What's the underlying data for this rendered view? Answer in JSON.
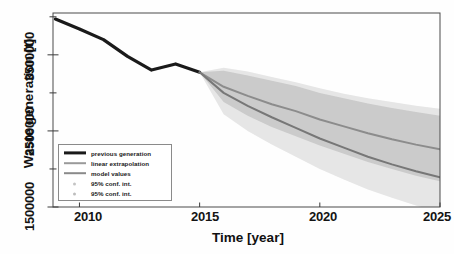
{
  "chart_data": {
    "type": "line",
    "title": "",
    "xlabel": "Time [year]",
    "ylabel": "Waste generation [t]",
    "xlim": [
      2008.9,
      2025
    ],
    "ylim": [
      1500000,
      4050000
    ],
    "xticks": [
      2010,
      2015,
      2020,
      2025
    ],
    "yticks": [
      1500000,
      2500000,
      3500000
    ],
    "ytick_labels": [
      "1500000",
      "2500000",
      "3500000"
    ],
    "yminor_ticks": [
      2000000,
      3000000,
      4000000
    ],
    "grid": false,
    "legend_position": "lower left",
    "series": [
      {
        "name": "previous generation",
        "type": "line",
        "color": "#1a1a1a",
        "width": 3.2,
        "x": [
          2009,
          2010,
          2011,
          2012,
          2013,
          2014,
          2015
        ],
        "values": [
          3970000,
          3840000,
          3700000,
          3480000,
          3300000,
          3380000,
          3270000
        ]
      },
      {
        "name": "linear extrapolation",
        "type": "line",
        "color": "#8c8c8c",
        "width": 2.0,
        "x": [
          2015,
          2016,
          2017,
          2018,
          2019,
          2020,
          2021,
          2022,
          2023,
          2024,
          2025
        ],
        "values": [
          3270000,
          3080000,
          2960000,
          2850000,
          2760000,
          2650000,
          2560000,
          2470000,
          2390000,
          2320000,
          2260000
        ]
      },
      {
        "name": "model values",
        "type": "line",
        "color": "#777777",
        "width": 2.0,
        "x": [
          2015,
          2016,
          2017,
          2018,
          2019,
          2020,
          2021,
          2022,
          2023,
          2024,
          2025
        ],
        "values": [
          3270000,
          3000000,
          2830000,
          2680000,
          2540000,
          2400000,
          2280000,
          2160000,
          2060000,
          1970000,
          1890000
        ]
      }
    ],
    "bands": [
      {
        "name": "95% conf. int.",
        "for": "linear extrapolation",
        "color": "#b9b9b9",
        "opacity": 0.62,
        "x": [
          2015,
          2016,
          2017,
          2018,
          2019,
          2020,
          2021,
          2022,
          2023,
          2024,
          2025
        ],
        "upper": [
          3270000,
          3290000,
          3230000,
          3160000,
          3090000,
          3000000,
          2930000,
          2860000,
          2800000,
          2750000,
          2700000
        ],
        "lower": [
          3270000,
          2880000,
          2700000,
          2550000,
          2430000,
          2310000,
          2200000,
          2090000,
          2000000,
          1910000,
          1840000
        ]
      },
      {
        "name": "95% conf. int.",
        "for": "model values",
        "color": "#d4d4d4",
        "opacity": 0.58,
        "x": [
          2015,
          2016,
          2017,
          2018,
          2019,
          2020,
          2021,
          2022,
          2023,
          2024,
          2025
        ],
        "upper": [
          3270000,
          3330000,
          3280000,
          3210000,
          3140000,
          3060000,
          2990000,
          2930000,
          2880000,
          2830000,
          2790000
        ],
        "lower": [
          3270000,
          2720000,
          2500000,
          2320000,
          2160000,
          2000000,
          1860000,
          1730000,
          1620000,
          1520000,
          1430000
        ]
      }
    ],
    "legend_entries": [
      {
        "label": "previous generation",
        "kind": "line",
        "color": "#1a1a1a",
        "width": 3.2
      },
      {
        "label": "linear extrapolation",
        "kind": "line",
        "color": "#9a9a9a",
        "width": 1.6
      },
      {
        "label": "model values",
        "kind": "line",
        "color": "#8a8a8a",
        "width": 1.6
      },
      {
        "label": "95% conf. int.",
        "kind": "marker",
        "color": "#c4c4c4"
      },
      {
        "label": "95% conf. int.",
        "kind": "marker",
        "color": "#bdbdbd"
      }
    ]
  },
  "axes": {
    "xtick_0": "2010",
    "xtick_1": "2015",
    "xtick_2": "2020",
    "xtick_3": "2025",
    "ytick_0": "1500000",
    "ytick_1": "2500000",
    "ytick_2": "3500000",
    "xlabel": "Time [year]",
    "ylabel": "Waste generation [t]"
  },
  "legend": {
    "item_0": "previous generation",
    "item_1": "linear extrapolation",
    "item_2": "model values",
    "item_3": "95% conf. int.",
    "item_4": "95% conf. int."
  }
}
